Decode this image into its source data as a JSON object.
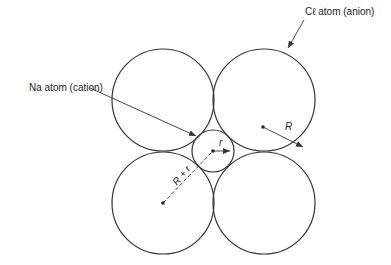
{
  "diagram": {
    "labels": {
      "anion": "Cℓ atom (anion)",
      "cation": "Na atom (cation)",
      "big_radius": "R",
      "small_radius": "r",
      "sum_radius": "R + r"
    },
    "colors": {
      "stroke": "#333333",
      "background": "#ffffff"
    },
    "large_circles": [
      {
        "cx": 163,
        "cy": 100,
        "r": 51
      },
      {
        "cx": 264,
        "cy": 100,
        "r": 51
      },
      {
        "cx": 163,
        "cy": 203,
        "r": 51
      },
      {
        "cx": 264,
        "cy": 203,
        "r": 51
      }
    ],
    "small_circle": {
      "cx": 213,
      "cy": 151,
      "r": 21
    }
  }
}
